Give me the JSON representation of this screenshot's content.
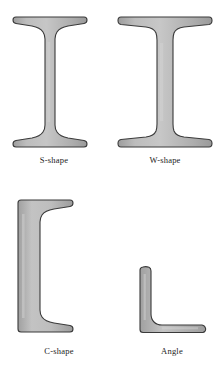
{
  "figure": {
    "background_color": "#ffffff",
    "fill_color": "#b2b2b2",
    "fill_highlight": "#c9c9c9",
    "fill_shadow": "#9a9a9a",
    "outline_color": "#3a3a3a",
    "label_color": "#1c1c1c"
  },
  "shapes": [
    {
      "id": "s-shape",
      "label": "S-shape",
      "profile": "I-beam with tapered flanges",
      "icon": "s-shape-cross-section-icon"
    },
    {
      "id": "w-shape",
      "label": "W-shape",
      "profile": "Wide-flange I-beam with parallel flanges",
      "icon": "w-shape-cross-section-icon"
    },
    {
      "id": "c-shape",
      "label": "C-shape",
      "profile": "Channel section with tapered flanges",
      "icon": "c-shape-cross-section-icon"
    },
    {
      "id": "angle",
      "label": "Angle",
      "profile": "L-shaped equal leg angle section",
      "icon": "angle-cross-section-icon"
    }
  ]
}
